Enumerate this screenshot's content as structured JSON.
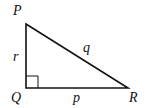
{
  "diagram": {
    "type": "right-triangle",
    "vertices": [
      {
        "name": "P",
        "x": 26,
        "y": 24
      },
      {
        "name": "Q",
        "x": 26,
        "y": 88
      },
      {
        "name": "R",
        "x": 128,
        "y": 88
      }
    ],
    "vertex_labels": {
      "P": "P",
      "Q": "Q",
      "R": "R"
    },
    "side_labels": {
      "QP": "r",
      "PR": "q",
      "QR": "p"
    },
    "right_angle_at": "Q",
    "stroke_color": "#111111"
  }
}
